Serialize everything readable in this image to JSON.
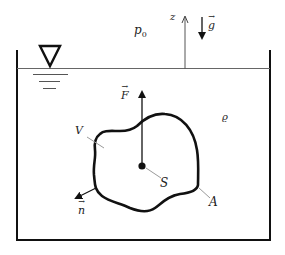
{
  "diagram": {
    "type": "hydrostatic-buoyancy-schematic",
    "labels": {
      "pressure": "p",
      "pressure_sub": "0",
      "z_axis": "z",
      "gravity": "g",
      "force": "F",
      "density": "ϱ",
      "volume": "V",
      "centroid": "S",
      "surface": "A",
      "normal": "n"
    },
    "colors": {
      "stroke": "#111111",
      "leader": "#9a9a9a",
      "background": "#ffffff"
    }
  }
}
